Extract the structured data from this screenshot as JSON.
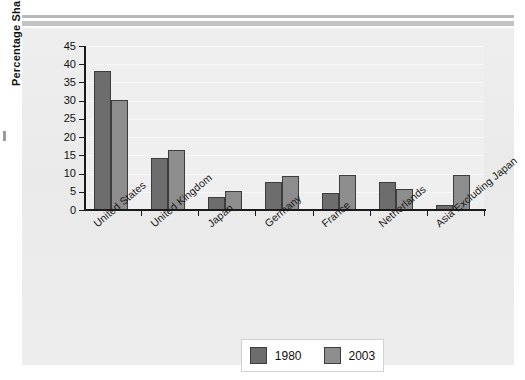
{
  "chart_data": {
    "type": "bar",
    "title": "",
    "xlabel": "",
    "ylabel": "Percentage Share",
    "ylim": [
      0,
      45
    ],
    "ytick_step": 5,
    "yticks": [
      45,
      40,
      35,
      30,
      25,
      20,
      15,
      10,
      5,
      0
    ],
    "grid": true,
    "legend_position": "bottom-center",
    "categories": [
      "United States",
      "United Kingdom",
      "Japan",
      "Germany",
      "France",
      "Netherlands",
      "Asia Excluding Japan"
    ],
    "series": [
      {
        "name": "1980",
        "color": "#6d6d6d",
        "values": [
          38.1,
          14.3,
          3.6,
          7.8,
          4.8,
          7.6,
          1.3
        ]
      },
      {
        "name": "2003",
        "color": "#8d8d8d",
        "values": [
          30.3,
          16.6,
          5.2,
          9.2,
          9.7,
          5.9,
          9.5
        ]
      }
    ]
  },
  "legend": {
    "items": [
      {
        "label": "1980",
        "color": "#6d6d6d"
      },
      {
        "label": "2003",
        "color": "#8d8d8d"
      }
    ]
  },
  "colors": {
    "series_1980": "#6d6d6d",
    "series_2003": "#8d8d8d",
    "panel_background": "#ececec",
    "plot_background": "#efefef",
    "axis": "#1a1a1a",
    "legend_background": "#ffffff"
  }
}
